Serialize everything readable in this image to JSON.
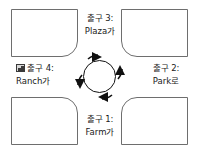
{
  "diagram": {
    "kind": "roundabout-intersection-diagram",
    "center": {
      "name": "roundabout",
      "direction": "clockwise",
      "arrow_count": 4
    },
    "exits": [
      {
        "id": "exit-1",
        "position": "bottom",
        "number_line": "출구 1:",
        "street_line": "Farm가"
      },
      {
        "id": "exit-2",
        "position": "right",
        "number_line": "출구 2:",
        "street_line": "Park로"
      },
      {
        "id": "exit-3",
        "position": "top",
        "number_line": "출구 3:",
        "street_line": "Plaza가"
      },
      {
        "id": "exit-4",
        "position": "left",
        "number_line": "출구 4:",
        "street_line": "Ranch가",
        "icon": "broken-image-icon"
      }
    ],
    "colors": {
      "line": "#6e6e6e",
      "ring": "#111111",
      "text": "#1a1a1a",
      "background": "#ffffff"
    }
  }
}
